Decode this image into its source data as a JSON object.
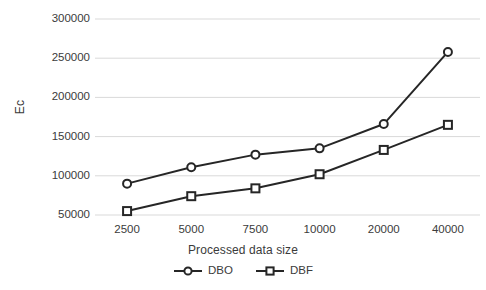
{
  "chart_data": {
    "type": "line",
    "title": "",
    "xlabel": "Processed data size",
    "ylabel": "Ec",
    "categories": [
      "2500",
      "5000",
      "7500",
      "10000",
      "20000",
      "40000"
    ],
    "yticks": [
      "50000",
      "100000",
      "150000",
      "200000",
      "250000",
      "300000"
    ],
    "ylim": [
      50000,
      300000
    ],
    "grid": true,
    "legend_position": "bottom",
    "series": [
      {
        "name": "DBO",
        "marker": "circle",
        "color": "#262626",
        "values": [
          90000,
          111000,
          127000,
          135000,
          166000,
          258000
        ]
      },
      {
        "name": "DBF",
        "marker": "square",
        "color": "#262626",
        "values": [
          55000,
          74000,
          84000,
          102000,
          133000,
          165000
        ]
      }
    ]
  },
  "style": {
    "line_color": "#262626",
    "grid_color": "#d9d9d9",
    "text_color": "#3b3b3b",
    "background": "#ffffff"
  }
}
